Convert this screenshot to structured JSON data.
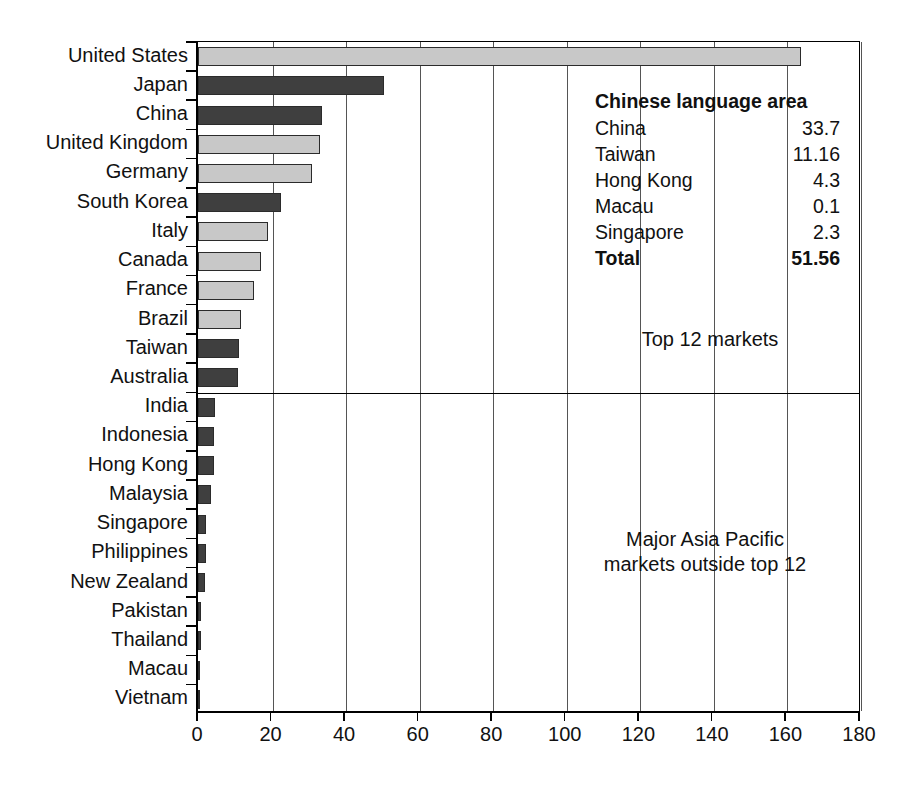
{
  "chart_data": {
    "type": "bar",
    "orientation": "horizontal",
    "title": "",
    "xlabel": "",
    "ylabel": "",
    "xlim": [
      0,
      180
    ],
    "xticks": [
      0,
      20,
      40,
      60,
      80,
      100,
      120,
      140,
      160,
      180
    ],
    "xtick_labels": [
      "0",
      "20",
      "40",
      "60",
      "80",
      "100",
      "120",
      "140",
      "160",
      "180"
    ],
    "grid": "vertical",
    "legend_position": "top-right",
    "categories": [
      "United States",
      "Japan",
      "China",
      "United Kingdom",
      "Germany",
      "South Korea",
      "Italy",
      "Canada",
      "France",
      "Brazil",
      "Taiwan",
      "Australia",
      "India",
      "Indonesia",
      "Hong Kong",
      "Malaysia",
      "Singapore",
      "Philippines",
      "New Zealand",
      "Pakistan",
      "Thailand",
      "Macau",
      "Vietnam"
    ],
    "values": [
      164,
      50.5,
      33.7,
      33.2,
      31.0,
      22.5,
      19.0,
      17.0,
      15.2,
      11.8,
      11.16,
      10.8,
      4.5,
      4.3,
      4.3,
      3.5,
      2.3,
      2.2,
      2.0,
      0.9,
      0.8,
      0.35,
      0.3
    ],
    "bar_shades": [
      "light",
      "dark",
      "dark",
      "light",
      "light",
      "dark",
      "light",
      "light",
      "light",
      "light",
      "dark",
      "dark",
      "dark",
      "dark",
      "dark",
      "dark",
      "dark",
      "dark",
      "dark",
      "dark",
      "dark",
      "dark",
      "dark"
    ],
    "group_divider_after_index": 11,
    "colors": {
      "light_bar": "#c8c8c8",
      "dark_bar": "#3f3f3f",
      "bar_border": "#2b2b2b",
      "axis": "#000000",
      "gridline": "#555555",
      "background": "#ffffff",
      "text": "#111111"
    }
  },
  "legend": {
    "title": "Chinese language area",
    "rows": [
      {
        "name": "China",
        "value": "33.7"
      },
      {
        "name": "Taiwan",
        "value": "11.16"
      },
      {
        "name": "Hong Kong",
        "value": "4.3"
      },
      {
        "name": "Macau",
        "value": "0.1"
      },
      {
        "name": "Singapore",
        "value": "2.3"
      }
    ],
    "total": {
      "name": "Total",
      "value": "51.56"
    }
  },
  "annotations": {
    "top_group": "Top 12 markets",
    "bottom_group_line1": "Major Asia Pacific",
    "bottom_group_line2": "markets outside top 12"
  }
}
